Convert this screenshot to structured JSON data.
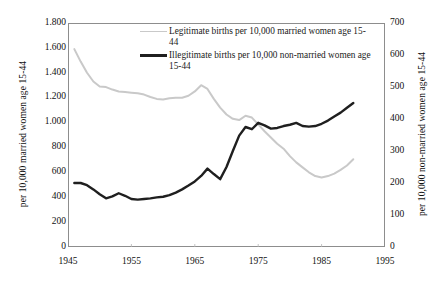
{
  "chart_data": {
    "type": "line",
    "title": "",
    "xlabel": "",
    "ylabel": "per 10,000 married women age 15-44",
    "ylabel_right": "per 10,000 non-married women age 15-44",
    "grid": false,
    "legend_position": "inside-top",
    "xlim": [
      1945,
      1995
    ],
    "ylim": [
      0,
      1800
    ],
    "ylim_right": [
      0,
      700
    ],
    "x_ticks": [
      "1945",
      "1955",
      "1965",
      "1975",
      "1985",
      "1995"
    ],
    "x_tick_values": [
      1945,
      1955,
      1965,
      1975,
      1985,
      1995
    ],
    "y_ticks_left": [
      "0",
      "200",
      "400",
      "600",
      "800",
      "1.000",
      "1.200",
      "1.400",
      "1.600",
      "1.800"
    ],
    "y_tick_values_left": [
      0,
      200,
      400,
      600,
      800,
      1000,
      1200,
      1400,
      1600,
      1800
    ],
    "y_ticks_right": [
      "0",
      "100",
      "200",
      "300",
      "400",
      "500",
      "600",
      "700"
    ],
    "y_tick_values_right": [
      0,
      100,
      200,
      300,
      400,
      500,
      600,
      700
    ],
    "series": [
      {
        "name": "Legitimate births per 10,000 married women age 15-44",
        "axis": "left",
        "color": "#c9c9c9",
        "width": 2.0,
        "x": [
          1946,
          1947,
          1948,
          1949,
          1950,
          1951,
          1952,
          1953,
          1954,
          1955,
          1956,
          1957,
          1958,
          1959,
          1960,
          1961,
          1962,
          1963,
          1964,
          1965,
          1966,
          1967,
          1968,
          1969,
          1970,
          1971,
          1972,
          1973,
          1974,
          1975,
          1976,
          1977,
          1978,
          1979,
          1980,
          1981,
          1982,
          1983,
          1984,
          1985,
          1986,
          1987,
          1988,
          1989,
          1990
        ],
        "values": [
          1590,
          1490,
          1400,
          1330,
          1290,
          1285,
          1265,
          1250,
          1245,
          1240,
          1235,
          1225,
          1205,
          1190,
          1185,
          1195,
          1200,
          1200,
          1215,
          1250,
          1300,
          1270,
          1190,
          1120,
          1065,
          1030,
          1020,
          1055,
          1040,
          985,
          930,
          880,
          830,
          790,
          730,
          680,
          640,
          600,
          570,
          558,
          570,
          590,
          620,
          655,
          705
        ]
      },
      {
        "name": "Illegitimate births per 10,000 non-married women age 15-44",
        "axis": "right",
        "color": "#1f1f1f",
        "width": 2.4,
        "x": [
          1946,
          1947,
          1948,
          1949,
          1950,
          1951,
          1952,
          1953,
          1954,
          1955,
          1956,
          1957,
          1958,
          1959,
          1960,
          1961,
          1962,
          1963,
          1964,
          1965,
          1966,
          1967,
          1968,
          1969,
          1970,
          1971,
          1972,
          1973,
          1974,
          1975,
          1976,
          1977,
          1978,
          1979,
          1980,
          1981,
          1982,
          1983,
          1984,
          1985,
          1986,
          1987,
          1988,
          1989,
          1990
        ],
        "values": [
          200,
          200,
          193,
          180,
          165,
          152,
          158,
          168,
          160,
          150,
          148,
          150,
          152,
          155,
          157,
          162,
          170,
          180,
          192,
          205,
          222,
          245,
          228,
          212,
          250,
          300,
          348,
          375,
          368,
          388,
          380,
          370,
          372,
          378,
          382,
          388,
          378,
          376,
          378,
          385,
          395,
          408,
          420,
          435,
          450
        ]
      }
    ]
  },
  "legend": {
    "entries": [
      {
        "label": "Legitimate births per 10,000 married women age 15-44",
        "color": "#c9c9c9",
        "style": "thin"
      },
      {
        "label": "Illegitimate births per 10,000 non-married women age 15-44",
        "color": "#1f1f1f",
        "style": "thick"
      }
    ]
  },
  "axes": {
    "left_title": "per 10,000 married women age 15-44",
    "right_title": "per 10,000 non-married women age 15-44"
  }
}
